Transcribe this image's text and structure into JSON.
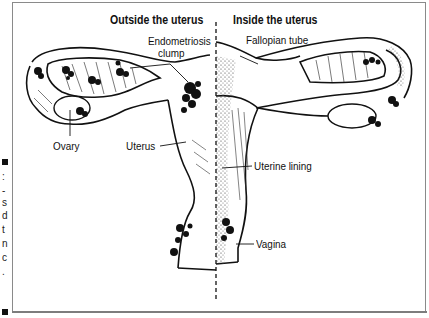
{
  "figure": {
    "headers": {
      "left": "Outside the uterus",
      "right": "Inside the uterus"
    },
    "labels": {
      "endometriosis_line1": "Endometriosis",
      "endometriosis_line2": "clump",
      "fallopian_tube": "Fallopian tube",
      "ovary": "Ovary",
      "uterus": "Uterus",
      "uterine_lining": "Uterine lining",
      "vagina": "Vagina"
    },
    "caption_fragment": [
      ":",
      "-",
      "s",
      "d",
      "t",
      "n",
      "c",
      "."
    ],
    "colors": {
      "ink": "#111111",
      "frame": "#8a8a8a",
      "background": "#ffffff"
    }
  }
}
